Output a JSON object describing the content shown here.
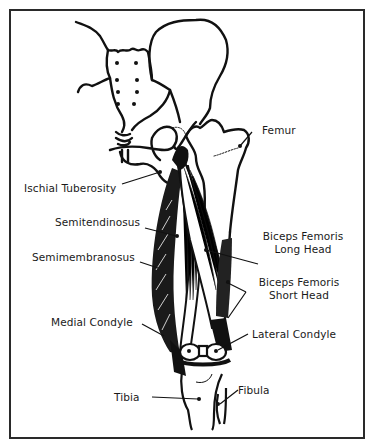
{
  "diagram": {
    "labels": {
      "femur": "Femur",
      "ischial_tuberosity": "Ischial Tuberosity",
      "semitendinosus": "Semitendinosus",
      "semimembranosus": "Semimembranosus",
      "biceps_long_1": "Biceps Femoris",
      "biceps_long_2": "Long Head",
      "biceps_short_1": "Biceps Femoris",
      "biceps_short_2": "Short Head",
      "medial_condyle": "Medial Condyle",
      "lateral_condyle": "Lateral Condyle",
      "tibia": "Tibia",
      "fibula": "Fibula"
    },
    "colors": {
      "ink": "#111111",
      "frame": "#2a2a2a",
      "background": "#ffffff"
    }
  }
}
